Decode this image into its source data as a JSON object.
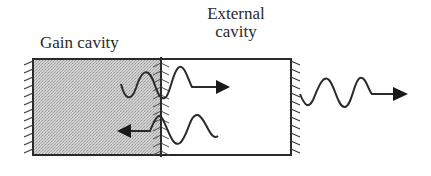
{
  "diagram": {
    "labels": {
      "gain_cavity": "Gain cavity",
      "external_cavity_line1": "External",
      "external_cavity_line2": "cavity"
    },
    "elements": [
      {
        "id": "gain-cavity",
        "shape": "rectangle",
        "fill": "stippled-gray",
        "label": "Gain cavity"
      },
      {
        "id": "external-cavity",
        "shape": "rectangle",
        "fill": "white",
        "label": "External cavity"
      },
      {
        "id": "left-mirror",
        "shape": "hatched-wall"
      },
      {
        "id": "middle-mirror",
        "shape": "hatched-wall",
        "note": "partially reflecting interface between cavities"
      },
      {
        "id": "right-mirror",
        "shape": "hatched-wall",
        "note": "output coupler"
      },
      {
        "id": "forward-wave",
        "shape": "sine-wave-with-arrow",
        "direction": "right",
        "crosses": "middle-mirror"
      },
      {
        "id": "reflected-wave",
        "shape": "sine-wave-with-arrow",
        "direction": "left",
        "crosses": "middle-mirror"
      },
      {
        "id": "output-wave",
        "shape": "sine-wave-with-arrow",
        "direction": "right",
        "location": "outside right mirror"
      }
    ],
    "colors": {
      "stroke": "#2a2a2a",
      "gain_fill": "#c8c8c8",
      "background": "#ffffff"
    }
  }
}
